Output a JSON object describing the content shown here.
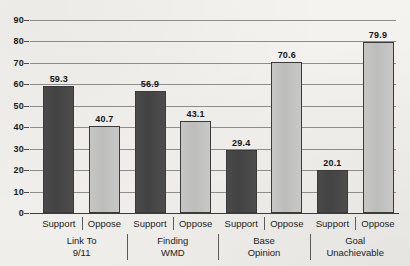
{
  "chart_data": {
    "type": "bar",
    "title": "",
    "subtitle": "",
    "xlabel": "",
    "ylabel": "",
    "ylim": [
      0,
      90
    ],
    "ytick_step": 10,
    "ytick_labels": [
      "90",
      "80",
      "70",
      "60",
      "50",
      "40",
      "30",
      "20",
      "10",
      "0"
    ],
    "ytick_values": [
      90,
      80,
      70,
      60,
      50,
      40,
      30,
      20,
      10,
      0
    ],
    "grid": "horizontal",
    "legend_position": "none",
    "categories": [
      "Link To 9/11",
      "Finding WMD",
      "Base Opinion",
      "Goal Unachievable"
    ],
    "series": [
      {
        "name": "Support",
        "values": [
          59.3,
          56.9,
          29.4,
          20.1
        ],
        "color": "#464646"
      },
      {
        "name": "Oppose",
        "values": [
          40.7,
          43.1,
          70.6,
          79.9
        ],
        "color": "#c2c2c0"
      }
    ],
    "bars": [
      {
        "group": 0,
        "series": "Support",
        "value": 59.3,
        "label": "59.3"
      },
      {
        "group": 0,
        "series": "Oppose",
        "value": 40.7,
        "label": "40.7"
      },
      {
        "group": 1,
        "series": "Support",
        "value": 56.9,
        "label": "56.9"
      },
      {
        "group": 1,
        "series": "Oppose",
        "value": 43.1,
        "label": "43.1"
      },
      {
        "group": 2,
        "series": "Support",
        "value": 29.4,
        "label": "29.4"
      },
      {
        "group": 2,
        "series": "Oppose",
        "value": 70.6,
        "label": "70.6"
      },
      {
        "group": 3,
        "series": "Support",
        "value": 20.1,
        "label": "20.1"
      },
      {
        "group": 3,
        "series": "Oppose",
        "value": 79.9,
        "label": "79.9"
      }
    ],
    "series_tick_labels": [
      "Support",
      "Oppose",
      "Support",
      "Oppose",
      "Support",
      "Oppose",
      "Support",
      "Oppose"
    ],
    "group_labels": [
      {
        "line1": "Link To",
        "line2": "9/11"
      },
      {
        "line1": "Finding",
        "line2": "WMD"
      },
      {
        "line1": "Base",
        "line2": "Opinion"
      },
      {
        "line1": "Goal",
        "line2": "Unachievable"
      }
    ],
    "colors": {
      "support_bar": "#464646",
      "oppose_bar": "#c2c2c0",
      "bar_border": "#3a3a3a",
      "gridline": "#8d8d8d",
      "axis": "#3c3c3c",
      "text": "#1c1c1c",
      "background": "#f2f1ed"
    }
  }
}
